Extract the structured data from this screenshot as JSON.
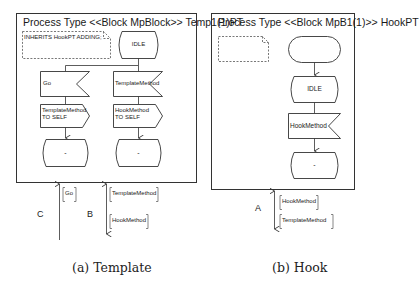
{
  "figure": {
    "panels": [
      {
        "id": "template",
        "title": "Process Type <<Block MpBlock>> Temp1(1)PT",
        "comment": "INHERITS HookPT ADDING;",
        "start_state": "IDLE",
        "left_branch": {
          "input": "Go",
          "output_line1": "TemplateMethod",
          "output_line2": "TO SELF",
          "next_state": "-"
        },
        "right_branch": {
          "input": "TemplateMethod",
          "output_line1": "HookMethod",
          "output_line2": "TO SELF",
          "next_state": "-"
        },
        "channels": [
          {
            "label": "C",
            "signals": [
              "Go"
            ],
            "direction": "in"
          },
          {
            "label": "B",
            "signals_in": [
              "TemplateMethod"
            ],
            "signals_out": [
              "HookMethod"
            ],
            "direction": "bidirectional"
          }
        ],
        "caption": "(a) Template"
      },
      {
        "id": "hook",
        "title": "Process Type <<Block MpB1(1)>> HookPT",
        "comment": "",
        "start_state": "",
        "state": "IDLE",
        "input": "HookMethod",
        "next_state": "-",
        "channels": [
          {
            "label": "A",
            "signals_in": [
              "HookMethod"
            ],
            "signals_out": [
              "TemplateMethod"
            ],
            "direction": "bidirectional"
          }
        ],
        "caption": "(b) Hook"
      }
    ]
  }
}
